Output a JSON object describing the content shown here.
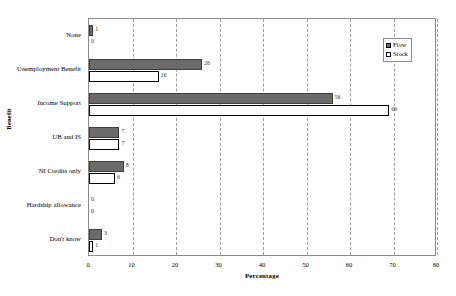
{
  "clipped_caption_text": "",
  "legend": {
    "position": "top-right-inside",
    "entries": [
      {
        "label": "Flow",
        "color": "#6b6b6b",
        "swatch": "filled"
      },
      {
        "label": "Stock",
        "color": "#ffffff",
        "swatch": "empty"
      }
    ]
  },
  "chart_data": {
    "type": "bar",
    "orientation": "horizontal",
    "title": "",
    "xlabel": "Percentage",
    "ylabel": "Benefit",
    "xlim": [
      0,
      80
    ],
    "xticks": [
      0,
      10,
      20,
      30,
      40,
      50,
      60,
      70,
      80
    ],
    "xtick_labels": [
      "0",
      "10",
      "20",
      "30",
      "40",
      "50",
      "60",
      "70",
      "80"
    ],
    "grid": "vertical-dashed",
    "legend_position": "upper right",
    "categories": [
      "None",
      "Unemployment Benefit",
      "Income Support",
      "UB and IS",
      "NI Credits only",
      "Hardship allowance",
      "Don't know"
    ],
    "series": [
      {
        "name": "Flow",
        "color": "#6b6b6b",
        "values": [
          1,
          26,
          56,
          7,
          8,
          0,
          3
        ],
        "value_labels": [
          "1",
          "26",
          "56",
          "7",
          "8",
          "0",
          "3"
        ]
      },
      {
        "name": "Stock",
        "color": "#ffffff",
        "values": [
          0,
          16,
          69,
          7,
          6,
          0,
          1
        ],
        "value_labels": [
          "0",
          "16",
          "69",
          "7",
          "6",
          "0",
          "1"
        ]
      }
    ]
  }
}
